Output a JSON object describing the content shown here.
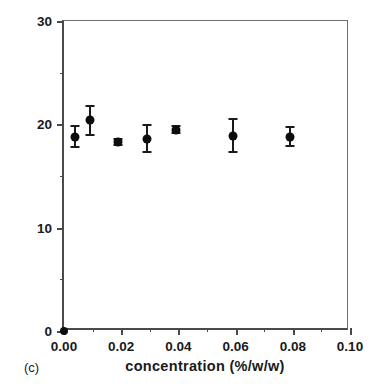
{
  "figure": {
    "panel_label": "(c)",
    "background": "#ffffff",
    "ink_color": "#1a1a1a",
    "marker_color": "#0d0d0d"
  },
  "chart_data": {
    "type": "scatter",
    "title": "",
    "xlabel": "concentration  (%/w/w)",
    "ylabel": "amount transported  (µg/hour)",
    "xlim": [
      0.0,
      0.1
    ],
    "ylim": [
      0,
      30
    ],
    "grid": false,
    "legend": null,
    "x_major_ticks": [
      0.0,
      0.02,
      0.04,
      0.06,
      0.08,
      0.1
    ],
    "x_major_tick_labels": [
      "0.00",
      "0.02",
      "0.04",
      "0.06",
      "0.08",
      "0.10"
    ],
    "x_minor_ticks": [
      0.01,
      0.03,
      0.05,
      0.07,
      0.09
    ],
    "y_major_ticks": [
      0,
      10,
      20,
      30
    ],
    "y_major_tick_labels": [
      "0",
      "10",
      "20",
      "30"
    ],
    "y_minor_ticks": [
      5,
      15,
      25
    ],
    "series": [
      {
        "name": "amount transported",
        "marker": "filled-circle",
        "x": [
          0.0,
          0.004,
          0.009,
          0.019,
          0.029,
          0.039,
          0.059,
          0.079
        ],
        "y": [
          0.0,
          18.8,
          20.4,
          18.3,
          18.6,
          19.5,
          18.9,
          18.8
        ],
        "yerr": [
          0.0,
          1.0,
          1.4,
          0.3,
          1.3,
          0.3,
          1.6,
          0.9
        ]
      }
    ]
  }
}
